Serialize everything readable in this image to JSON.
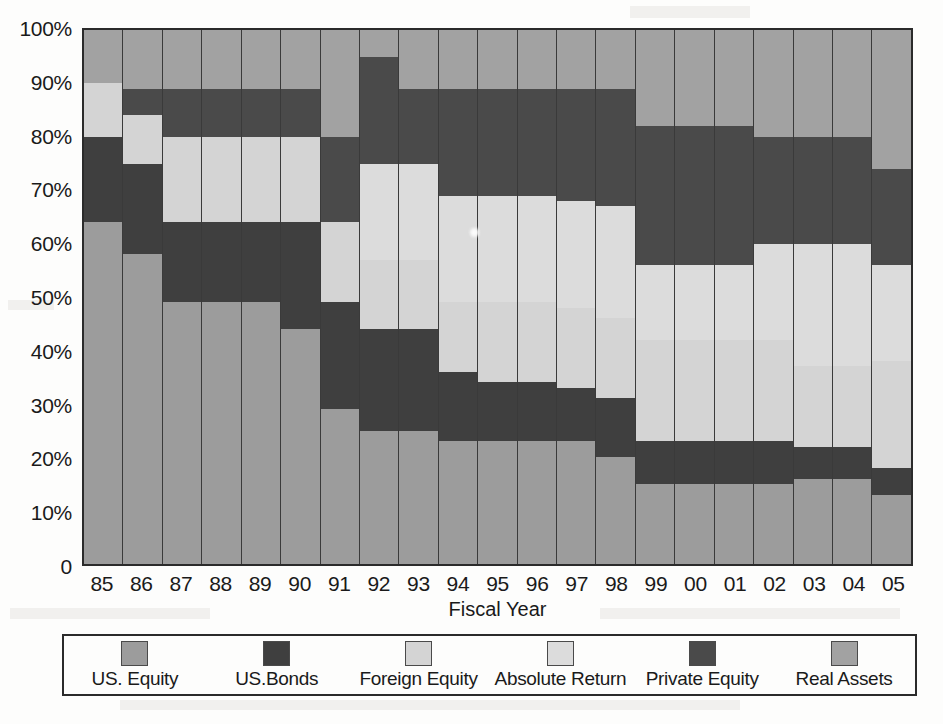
{
  "chart_data": {
    "type": "bar",
    "subtype": "stacked-percentage",
    "title": "",
    "xlabel": "Fiscal Year",
    "ylabel": "",
    "ylim": [
      0,
      100
    ],
    "y_unit": "%",
    "grid": false,
    "legend_position": "bottom",
    "categories": [
      "85",
      "86",
      "87",
      "88",
      "89",
      "90",
      "91",
      "92",
      "93",
      "94",
      "95",
      "96",
      "97",
      "98",
      "99",
      "00",
      "01",
      "02",
      "03",
      "04",
      "05"
    ],
    "ytick_labels": [
      "100%",
      "90%",
      "80%",
      "70%",
      "60%",
      "50%",
      "40%",
      "30%",
      "20%",
      "10%",
      "0"
    ],
    "ytick_values": [
      100,
      90,
      80,
      70,
      60,
      50,
      40,
      30,
      20,
      10,
      0
    ],
    "series": [
      {
        "name": "US. Equity",
        "key": "us-equity",
        "color": "#9c9c9c",
        "values": [
          64,
          58,
          49,
          49,
          49,
          44,
          29,
          25,
          25,
          23,
          23,
          23,
          23,
          20,
          15,
          15,
          15,
          15,
          16,
          16,
          13
        ]
      },
      {
        "name": "US.Bonds",
        "key": "us-bonds",
        "color": "#3f3f3f",
        "values": [
          16,
          17,
          15,
          15,
          15,
          20,
          20,
          19,
          19,
          13,
          11,
          11,
          10,
          11,
          8,
          8,
          8,
          8,
          6,
          6,
          5
        ]
      },
      {
        "name": "Foreign Equity",
        "key": "foreign-equity",
        "color": "#d4d4d4",
        "values": [
          10,
          9,
          16,
          16,
          16,
          16,
          15,
          13,
          13,
          13,
          15,
          15,
          15,
          15,
          19,
          19,
          19,
          19,
          15,
          15,
          20
        ]
      },
      {
        "name": "Absolute Return",
        "key": "absolute-return",
        "color": "#dcdcdc",
        "values": [
          0,
          0,
          0,
          0,
          0,
          0,
          0,
          18,
          18,
          20,
          20,
          20,
          20,
          21,
          14,
          14,
          14,
          18,
          23,
          23,
          18
        ]
      },
      {
        "name": "Private Equity",
        "key": "private-equity",
        "color": "#4a4a4a",
        "values": [
          0,
          5,
          9,
          9,
          9,
          9,
          16,
          20,
          14,
          20,
          20,
          20,
          21,
          22,
          26,
          26,
          26,
          20,
          20,
          20,
          18
        ]
      },
      {
        "name": "Real Assets",
        "key": "real-assets",
        "color": "#a2a2a2",
        "values": [
          10,
          11,
          11,
          11,
          11,
          11,
          20,
          5,
          11,
          11,
          11,
          11,
          11,
          11,
          18,
          18,
          18,
          20,
          20,
          20,
          26
        ]
      }
    ],
    "stack_boundaries_pct": {
      "85": [
        0,
        64,
        80,
        90,
        90,
        90,
        100
      ],
      "86": [
        0,
        58,
        75,
        84,
        84,
        89,
        100
      ],
      "87": [
        0,
        49,
        64,
        80,
        80,
        89,
        100
      ],
      "88": [
        0,
        49,
        64,
        80,
        80,
        89,
        100
      ],
      "89": [
        0,
        49,
        64,
        80,
        80,
        89,
        100
      ],
      "90": [
        0,
        44,
        64,
        80,
        80,
        89,
        100
      ],
      "91": [
        0,
        29,
        49,
        64,
        64,
        80,
        100
      ],
      "92": [
        0,
        25,
        44,
        57,
        75,
        95,
        100
      ],
      "93": [
        0,
        25,
        44,
        57,
        75,
        89,
        100
      ],
      "94": [
        0,
        23,
        36,
        49,
        69,
        89,
        100
      ],
      "95": [
        0,
        23,
        34,
        49,
        69,
        89,
        100
      ],
      "96": [
        0,
        23,
        34,
        49,
        69,
        89,
        100
      ],
      "97": [
        0,
        23,
        33,
        48,
        68,
        89,
        100
      ],
      "98": [
        0,
        20,
        31,
        46,
        67,
        89,
        100
      ],
      "99": [
        0,
        15,
        23,
        42,
        56,
        82,
        100
      ],
      "00": [
        0,
        15,
        23,
        42,
        56,
        82,
        100
      ],
      "01": [
        0,
        15,
        23,
        42,
        56,
        82,
        100
      ],
      "02": [
        0,
        15,
        23,
        42,
        60,
        80,
        100
      ],
      "03": [
        0,
        16,
        22,
        37,
        60,
        80,
        100
      ],
      "04": [
        0,
        16,
        22,
        37,
        60,
        80,
        100
      ],
      "05": [
        0,
        13,
        18,
        38,
        56,
        74,
        100
      ]
    }
  },
  "legend": {
    "items": [
      {
        "label": "US. Equity",
        "color": "#9c9c9c"
      },
      {
        "label": "US.Bonds",
        "color": "#3f3f3f"
      },
      {
        "label": "Foreign Equity",
        "color": "#d4d4d4"
      },
      {
        "label": "Absolute Return",
        "color": "#dcdcdc"
      },
      {
        "label": "Private Equity",
        "color": "#4a4a4a"
      },
      {
        "label": "Real Assets",
        "color": "#a2a2a2"
      }
    ]
  }
}
